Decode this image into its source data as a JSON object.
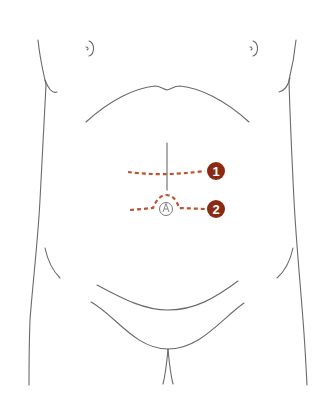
{
  "diagram": {
    "colors": {
      "outline": "#6a6a6a",
      "incision": "#c0522f",
      "badge": "#8b2a12",
      "badge_text": "#ffffff",
      "navel": "#7a7a7a"
    },
    "labels": [
      {
        "id": 1,
        "text": "1",
        "description": "upper transverse incision line above navel"
      },
      {
        "id": 2,
        "text": "2",
        "description": "periumbilical incision line arching over navel"
      }
    ],
    "icons": {
      "navel": "navel-icon"
    }
  }
}
